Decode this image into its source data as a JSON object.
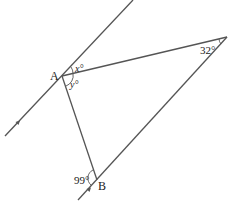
{
  "diagram": {
    "points": {
      "A": {
        "label": "A"
      },
      "B": {
        "label": "B"
      }
    },
    "angles": {
      "x": {
        "label": "x°"
      },
      "y": {
        "label": "y°"
      },
      "apex": {
        "label": "32°"
      },
      "B": {
        "label": "99°"
      }
    },
    "colors": {
      "line": "#555555",
      "text": "#222222",
      "background": "#ffffff"
    }
  }
}
